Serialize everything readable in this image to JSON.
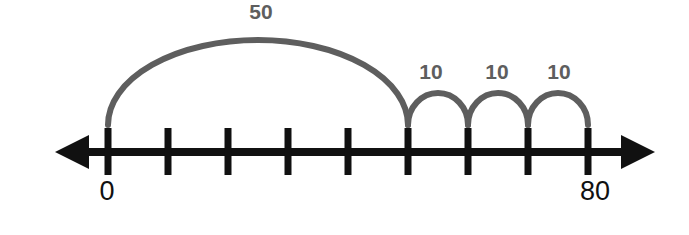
{
  "figure": {
    "background_color": "#ffffff",
    "axis_color": "#111111",
    "arc_color": "#5e5e5e",
    "arc_label_color": "#5e5e5e",
    "axis_label_color": "#111111"
  },
  "number_line": {
    "start_value": 0,
    "end_value": 80,
    "tick_step": 10,
    "tick_values": [
      0,
      10,
      20,
      30,
      40,
      50,
      60,
      70,
      80
    ],
    "tick_x": [
      108,
      168,
      228,
      288,
      348,
      408,
      468,
      528,
      588
    ],
    "axis_y": 152,
    "tick_top_y": 128,
    "tick_bottom_y": 175,
    "left_arrow_tip_x": 55,
    "right_arrow_tip_x": 655,
    "line_thickness": 8,
    "tick_thickness": 7,
    "labels": [
      {
        "text": "0",
        "x": 107,
        "y": 193
      },
      {
        "text": "80",
        "x": 595,
        "y": 193
      }
    ]
  },
  "jumps": [
    {
      "label": "50",
      "value": 50,
      "from_value": 0,
      "to_value": 50,
      "from_x": 108,
      "to_x": 408,
      "peak_y": 40,
      "label_x": 261,
      "label_y": 13,
      "stroke_width": 6
    },
    {
      "label": "10",
      "value": 10,
      "from_value": 50,
      "to_value": 60,
      "from_x": 408,
      "to_x": 468,
      "peak_y": 93,
      "label_x": 431,
      "label_y": 73,
      "stroke_width": 6
    },
    {
      "label": "10",
      "value": 10,
      "from_value": 60,
      "to_value": 70,
      "from_x": 468,
      "to_x": 528,
      "peak_y": 93,
      "label_x": 497,
      "label_y": 73,
      "stroke_width": 6
    },
    {
      "label": "10",
      "value": 10,
      "from_value": 70,
      "to_value": 80,
      "from_x": 528,
      "to_x": 588,
      "peak_y": 93,
      "label_x": 559,
      "label_y": 73,
      "stroke_width": 6
    }
  ],
  "chart_data": {
    "type": "line",
    "xlabel": "",
    "ylabel": "",
    "xlim": [
      0,
      80
    ],
    "grid": false,
    "legend_position": "none",
    "x_tick_labels": [
      "0",
      "",
      "",
      "",
      "",
      "",
      "",
      "",
      "80"
    ],
    "x_tick_values": [
      0,
      10,
      20,
      30,
      40,
      50,
      60,
      70,
      80
    ],
    "annotations": [
      "50",
      "10",
      "10",
      "10"
    ],
    "series": [
      {
        "name": "jumps",
        "categories": [
          "0→50",
          "50→60",
          "60→70",
          "70→80"
        ],
        "values": [
          50,
          10,
          10,
          10
        ]
      }
    ]
  }
}
